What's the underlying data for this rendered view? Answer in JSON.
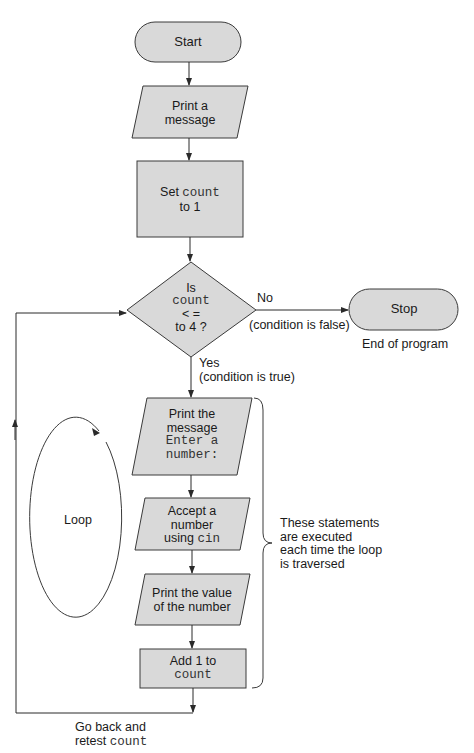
{
  "colors": {
    "shape_fill": "#d9d9d9",
    "stroke": "#3a3a3a",
    "text": "#1a1a1a",
    "background": "#ffffff"
  },
  "nodes": {
    "start": {
      "type": "terminal",
      "label": "Start"
    },
    "print_message": {
      "type": "io",
      "line1": "Print a",
      "line2": "message"
    },
    "set_count": {
      "type": "process",
      "text": "Set",
      "code": "count",
      "line2": "to 1"
    },
    "decision": {
      "type": "decision",
      "line1": "Is",
      "code": "count",
      "line3": "< =",
      "line4": "to 4 ?"
    },
    "stop": {
      "type": "terminal",
      "label": "Stop",
      "caption": "End of program"
    },
    "print_prompt": {
      "type": "io",
      "line1": "Print the",
      "line2": "message",
      "code1": "Enter a",
      "code2": "number:"
    },
    "accept_number": {
      "type": "io",
      "line1": "Accept a",
      "line2": "number",
      "line3_text": "using",
      "line3_code": "cin"
    },
    "print_value": {
      "type": "io",
      "line1": "Print the value",
      "line2": "of the number"
    },
    "add_one": {
      "type": "process",
      "line1": "Add 1 to",
      "code": "count"
    }
  },
  "edges": {
    "no_label": "No",
    "no_condition": "(condition is false)",
    "yes_label": "Yes",
    "yes_condition": "(condition is true)",
    "loop_back_line1": "Go back and",
    "loop_back_text": "retest",
    "loop_back_code": "count"
  },
  "annotations": {
    "loop_label": "Loop",
    "brace_text": [
      "These statements",
      "are executed",
      "each time the loop",
      "is traversed"
    ]
  }
}
